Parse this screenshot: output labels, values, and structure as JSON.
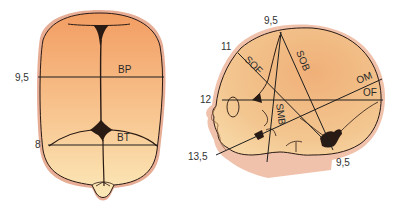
{
  "top_view": {
    "title": "Fetal skull - superior view",
    "measurements": [
      {
        "abbr": "BP",
        "value": "9,5"
      },
      {
        "abbr": "BT",
        "value": "8"
      }
    ]
  },
  "side_view": {
    "title": "Fetal skull - lateral view",
    "measurements": [
      {
        "abbr": "SOB",
        "value": "9,5"
      },
      {
        "abbr": "SOF",
        "value": "11"
      },
      {
        "abbr": "OF",
        "value": "12"
      },
      {
        "abbr": "SMB",
        "value": "9,5"
      },
      {
        "abbr": "OM",
        "value": "13,5"
      }
    ]
  },
  "colors": {
    "skin_outline": "#e6a48c",
    "bone_top": "#f4a46a",
    "bone_bottom": "#fbe6b4",
    "suture": "#2a1a14",
    "line": "#1e1e1e"
  }
}
